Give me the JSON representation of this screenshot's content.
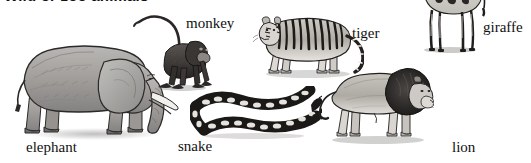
{
  "heading": "Wild or zoo animals",
  "page_background": "#ffffff",
  "ink_color": "#111111",
  "figures": [
    {
      "id": "elephant",
      "label": "elephant",
      "icon_name": "elephant-illustration",
      "facing": "right",
      "style": "grayscale engraving"
    },
    {
      "id": "monkey",
      "label": "monkey",
      "icon_name": "monkey-illustration",
      "facing": "right",
      "style": "grayscale engraving"
    },
    {
      "id": "tiger",
      "label": "tiger",
      "icon_name": "tiger-illustration",
      "facing": "left",
      "style": "grayscale engraving"
    },
    {
      "id": "giraffe",
      "label": "giraffe",
      "icon_name": "giraffe-illustration",
      "facing": "left",
      "style": "grayscale engraving"
    },
    {
      "id": "snake",
      "label": "snake",
      "icon_name": "snake-illustration",
      "facing": "right",
      "style": "grayscale engraving"
    },
    {
      "id": "lion",
      "label": "lion",
      "icon_name": "lion-illustration",
      "facing": "right",
      "style": "grayscale engraving"
    }
  ],
  "labels": {
    "elephant": "elephant",
    "monkey": "monkey",
    "tiger": "tiger",
    "giraffe": "giraffe",
    "snake": "snake",
    "lion": "lion"
  }
}
